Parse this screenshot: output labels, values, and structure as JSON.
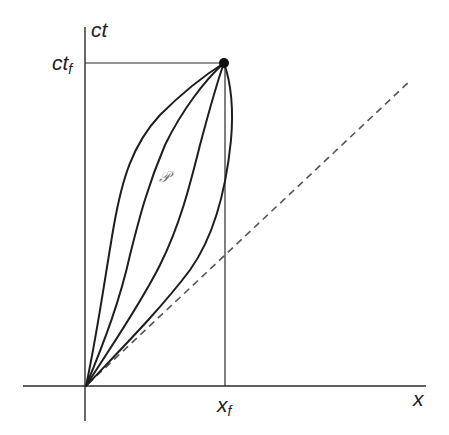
{
  "diagram": {
    "title": "",
    "type": "spacetime-worldlines",
    "colors": {
      "background": "#ffffff",
      "ink": "#1e1e1e",
      "dashed_line": "#555555",
      "script_label": "#666666"
    },
    "axes": {
      "vertical_label": "ct",
      "horizontal_label": "x"
    },
    "ticks": {
      "ct_f": {
        "base": "ct",
        "subscript": "f"
      },
      "x_f": {
        "base": "x",
        "subscript": "f"
      }
    },
    "region_label": "𝒫",
    "elements": {
      "origin_point": "origin",
      "end_event": "filled-dot at (x_f, ct_f)",
      "worldline_count": 4,
      "light_line": "dashed, 45 degrees through origin"
    }
  }
}
